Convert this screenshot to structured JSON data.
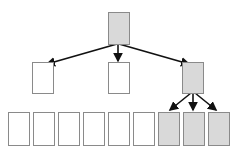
{
  "diagram": {
    "type": "tree",
    "colors": {
      "shaded_fill": "#d9d9d9",
      "empty_fill": "#ffffff",
      "box_stroke": "#8a8a8a",
      "arrow": "#111111"
    },
    "root": {
      "x": 108,
      "y": 12,
      "w": 21,
      "h": 32,
      "shaded": true
    },
    "level1": [
      {
        "x": 32,
        "y": 62,
        "w": 21,
        "h": 31,
        "shaded": false
      },
      {
        "x": 108,
        "y": 62,
        "w": 21,
        "h": 31,
        "shaded": false
      },
      {
        "x": 182,
        "y": 62,
        "w": 21,
        "h": 31,
        "shaded": true
      }
    ],
    "level2": [
      {
        "x": 8,
        "y": 112,
        "w": 21,
        "h": 33,
        "shaded": false
      },
      {
        "x": 33,
        "y": 112,
        "w": 21,
        "h": 33,
        "shaded": false
      },
      {
        "x": 58,
        "y": 112,
        "w": 21,
        "h": 33,
        "shaded": false
      },
      {
        "x": 83,
        "y": 112,
        "w": 21,
        "h": 33,
        "shaded": false
      },
      {
        "x": 108,
        "y": 112,
        "w": 21,
        "h": 33,
        "shaded": false
      },
      {
        "x": 133,
        "y": 112,
        "w": 21,
        "h": 33,
        "shaded": false
      },
      {
        "x": 158,
        "y": 112,
        "w": 21,
        "h": 33,
        "shaded": true
      },
      {
        "x": 183,
        "y": 112,
        "w": 21,
        "h": 33,
        "shaded": true
      },
      {
        "x": 208,
        "y": 112,
        "w": 21,
        "h": 33,
        "shaded": true
      }
    ],
    "edges": [
      {
        "from": "root",
        "to": "level1.0",
        "x1": 117,
        "y1": 44,
        "x2": 47,
        "y2": 64
      },
      {
        "from": "root",
        "to": "level1.1",
        "x1": 118,
        "y1": 44,
        "x2": 118,
        "y2": 61
      },
      {
        "from": "root",
        "to": "level1.2",
        "x1": 119,
        "y1": 44,
        "x2": 189,
        "y2": 64
      },
      {
        "from": "level1.2",
        "to": "level2.6",
        "x1": 191,
        "y1": 93,
        "x2": 170,
        "y2": 110
      },
      {
        "from": "level1.2",
        "to": "level2.7",
        "x1": 193,
        "y1": 93,
        "x2": 193,
        "y2": 110
      },
      {
        "from": "level1.2",
        "to": "level2.8",
        "x1": 195,
        "y1": 93,
        "x2": 216,
        "y2": 110
      }
    ]
  }
}
